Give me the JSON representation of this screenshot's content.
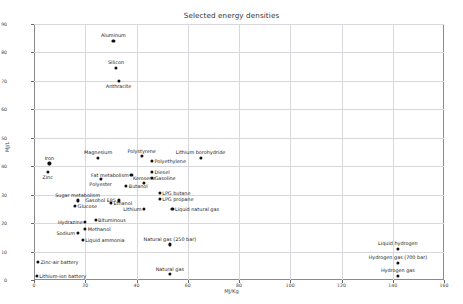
{
  "chart_data": {
    "type": "scatter",
    "title": "Selected energy densities",
    "xlabel": "MJ/Kg",
    "ylabel": "MJ/L",
    "xlim": [
      0,
      160
    ],
    "ylim": [
      0,
      90
    ],
    "xticks": [
      0,
      20,
      40,
      60,
      80,
      100,
      120,
      140,
      160
    ],
    "yticks": [
      0,
      10,
      20,
      30,
      40,
      50,
      60,
      70,
      80,
      90
    ],
    "grid": true,
    "legend": "none",
    "marker_color": "#111111",
    "points": [
      {
        "label": "Aluminum",
        "x": 31,
        "y": 84,
        "pos": "above"
      },
      {
        "label": "Silicon",
        "x": 32,
        "y": 74.5,
        "pos": "above"
      },
      {
        "label": "Anthracite",
        "x": 33,
        "y": 70,
        "pos": "below"
      },
      {
        "label": "Lithium borohydride",
        "x": 65,
        "y": 43,
        "pos": "above"
      },
      {
        "label": "Polystyrene",
        "x": 42,
        "y": 43.5,
        "pos": "above"
      },
      {
        "label": "Polyethylene",
        "x": 46,
        "y": 42,
        "pos": "right"
      },
      {
        "label": "Magnesium",
        "x": 25,
        "y": 43,
        "pos": "above"
      },
      {
        "label": "Iron",
        "x": 6,
        "y": 41,
        "pos": "above"
      },
      {
        "label": "Zinc",
        "x": 5.3,
        "y": 38,
        "pos": "below"
      },
      {
        "label": "Diesel",
        "x": 46,
        "y": 38,
        "pos": "right"
      },
      {
        "label": "Gasoline",
        "x": 46,
        "y": 36,
        "pos": "right"
      },
      {
        "label": "Fat metabolism",
        "x": 38,
        "y": 37,
        "pos": "left"
      },
      {
        "label": "Polyester",
        "x": 26,
        "y": 35.5,
        "pos": "below"
      },
      {
        "label": "Kerosene",
        "x": 43,
        "y": 34,
        "pos": "above"
      },
      {
        "label": "Butanol",
        "x": 36,
        "y": 33,
        "pos": "right"
      },
      {
        "label": "LPG butane",
        "x": 49,
        "y": 30.5,
        "pos": "right"
      },
      {
        "label": "LPG propane",
        "x": 49,
        "y": 28.5,
        "pos": "right"
      },
      {
        "label": "Gasohol E85",
        "x": 33,
        "y": 28,
        "pos": "left"
      },
      {
        "label": "Ethanol",
        "x": 30,
        "y": 27,
        "pos": "right"
      },
      {
        "label": "Sugar metabolism",
        "x": 17,
        "y": 28,
        "pos": "above"
      },
      {
        "label": "Glucose",
        "x": 16,
        "y": 26,
        "pos": "right"
      },
      {
        "label": "Lithium",
        "x": 43,
        "y": 25,
        "pos": "left"
      },
      {
        "label": "Liquid natural gas",
        "x": 54,
        "y": 25,
        "pos": "right"
      },
      {
        "label": "Bituminous",
        "x": 24,
        "y": 21,
        "pos": "right"
      },
      {
        "label": "Hydrazine",
        "x": 20,
        "y": 20.5,
        "pos": "left"
      },
      {
        "label": "Methanol",
        "x": 20,
        "y": 18,
        "pos": "right"
      },
      {
        "label": "Sodium",
        "x": 17,
        "y": 16.5,
        "pos": "left"
      },
      {
        "label": "Liquid ammonia",
        "x": 19,
        "y": 14,
        "pos": "right"
      },
      {
        "label": "Natural gas (250 bar)",
        "x": 53,
        "y": 12.5,
        "pos": "above"
      },
      {
        "label": "Natural gas",
        "x": 53,
        "y": 2,
        "pos": "above"
      },
      {
        "label": "Liquid hydrogen",
        "x": 142,
        "y": 11,
        "pos": "above"
      },
      {
        "label": "Hydrogen gas (700 bar)",
        "x": 142,
        "y": 6,
        "pos": "above"
      },
      {
        "label": "Hydrogen gas",
        "x": 142,
        "y": 1.5,
        "pos": "above"
      },
      {
        "label": "Zinc-air battery",
        "x": 1.5,
        "y": 6.5,
        "pos": "right"
      },
      {
        "label": "Lithium-ion battery",
        "x": 1,
        "y": 1.5,
        "pos": "right"
      }
    ]
  }
}
